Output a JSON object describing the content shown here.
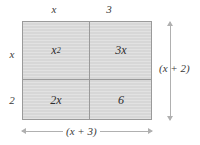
{
  "figure": {
    "type": "area-model",
    "top_labels": [
      "x",
      "3"
    ],
    "left_labels": [
      "x",
      "2"
    ],
    "cells": [
      {
        "position": "top-left",
        "base": "x",
        "exponent": "2"
      },
      {
        "position": "top-right",
        "base": "3x",
        "exponent": ""
      },
      {
        "position": "bottom-left",
        "base": "2x",
        "exponent": ""
      },
      {
        "position": "bottom-right",
        "base": "6",
        "exponent": ""
      }
    ],
    "dimensions": {
      "right_label": "(x + 2)",
      "bottom_label": "(x + 3)"
    },
    "colors": {
      "fill": "#d7d7d7",
      "stroke": "#9a9a9a",
      "dimension_line": "#b0b0b0",
      "text": "#3a3a3a"
    }
  }
}
